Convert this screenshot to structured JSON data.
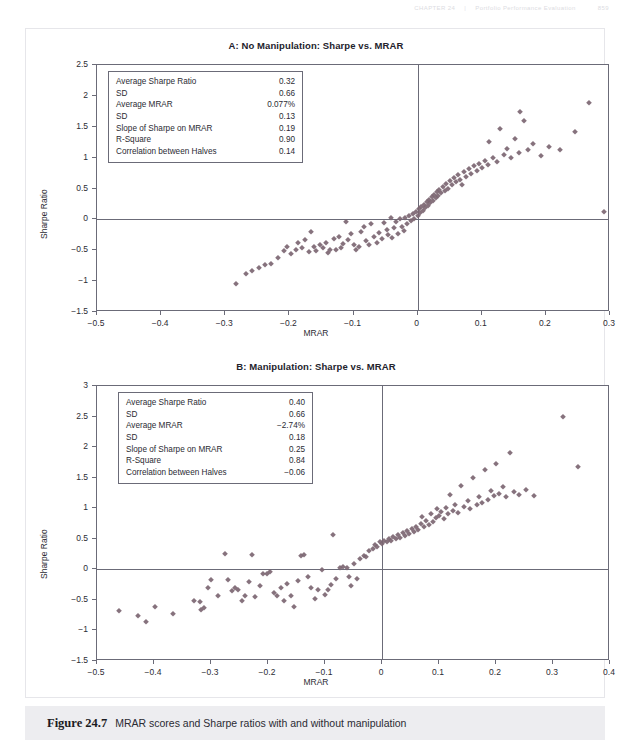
{
  "running_head": {
    "left": "CHAPTER 24",
    "section": "Portfolio Performance Evaluation",
    "page": "859"
  },
  "caption": {
    "figure_number": "Figure 24.7",
    "text": "MRAR scores and Sharpe ratios with and without manipulation"
  },
  "chart_data": [
    {
      "id": "panel-a",
      "type": "scatter",
      "title": "A: No Manipulation: Sharpe vs. MRAR",
      "xlabel": "MRAR",
      "ylabel": "Sharpe Ratio",
      "xlim": [
        -0.5,
        0.3
      ],
      "ylim": [
        -1.5,
        2.5
      ],
      "xticks": [
        -0.5,
        -0.4,
        -0.3,
        -0.2,
        -0.1,
        0,
        0.1,
        0.2,
        0.3
      ],
      "xticklabels": [
        "−0.5",
        "−0.4",
        "−0.3",
        "−0.2",
        "−0.1",
        "0",
        "0.1",
        "0.2",
        "0.3"
      ],
      "yticks": [
        -1.5,
        -1,
        -0.5,
        0,
        0.5,
        1,
        1.5,
        2,
        2.5
      ],
      "yticklabels": [
        "−1.5",
        "−1",
        "−0.5",
        "0",
        "0.5",
        "1",
        "1.5",
        "2",
        "2.5"
      ],
      "grid": false,
      "legend": null,
      "marker": {
        "shape": "diamond",
        "color": "#7c6672",
        "size": 4.4
      },
      "stats": [
        {
          "label": "Average Sharpe Ratio",
          "value": "0.32"
        },
        {
          "label": "SD",
          "value": "0.66"
        },
        {
          "label": "Average MRAR",
          "value": "0.077%"
        },
        {
          "label": "SD",
          "value": "0.13"
        },
        {
          "label": "Slope of Sharpe on MRAR",
          "value": "0.19"
        },
        {
          "label": "R-Square",
          "value": "0.90"
        },
        {
          "label": "Correlation between Halves",
          "value": "0.14"
        }
      ],
      "points": [
        [
          -0.283,
          -1.05
        ],
        [
          -0.268,
          -0.88
        ],
        [
          -0.258,
          -0.83
        ],
        [
          -0.248,
          -0.78
        ],
        [
          -0.238,
          -0.74
        ],
        [
          -0.228,
          -0.73
        ],
        [
          -0.218,
          -0.62
        ],
        [
          -0.209,
          -0.52
        ],
        [
          -0.203,
          -0.44
        ],
        [
          -0.197,
          -0.56
        ],
        [
          -0.19,
          -0.49
        ],
        [
          -0.186,
          -0.38
        ],
        [
          -0.181,
          -0.46
        ],
        [
          -0.176,
          -0.33
        ],
        [
          -0.17,
          -0.53
        ],
        [
          -0.166,
          -0.21
        ],
        [
          -0.162,
          -0.45
        ],
        [
          -0.158,
          -0.51
        ],
        [
          -0.152,
          -0.42
        ],
        [
          -0.148,
          -0.47
        ],
        [
          -0.143,
          -0.38
        ],
        [
          -0.14,
          -0.55
        ],
        [
          -0.136,
          -0.5
        ],
        [
          -0.131,
          -0.32
        ],
        [
          -0.127,
          -0.49
        ],
        [
          -0.123,
          -0.28
        ],
        [
          -0.12,
          -0.46
        ],
        [
          -0.116,
          -0.4
        ],
        [
          -0.112,
          -0.05
        ],
        [
          -0.108,
          -0.34
        ],
        [
          -0.104,
          -0.23
        ],
        [
          -0.1,
          -0.41
        ],
        [
          -0.096,
          -0.49
        ],
        [
          -0.092,
          -0.44
        ],
        [
          -0.088,
          -0.2
        ],
        [
          -0.084,
          -0.13
        ],
        [
          -0.08,
          -0.35
        ],
        [
          -0.076,
          -0.42
        ],
        [
          -0.072,
          -0.08
        ],
        [
          -0.068,
          -0.29
        ],
        [
          -0.064,
          -0.38
        ],
        [
          -0.06,
          -0.22
        ],
        [
          -0.056,
          -0.32
        ],
        [
          -0.052,
          -0.06
        ],
        [
          -0.048,
          -0.18
        ],
        [
          -0.046,
          -0.26
        ],
        [
          -0.042,
          0.03
        ],
        [
          -0.04,
          -0.3
        ],
        [
          -0.037,
          -0.14
        ],
        [
          -0.034,
          -0.05
        ],
        [
          -0.031,
          -0.24
        ],
        [
          -0.028,
          0.0
        ],
        [
          -0.025,
          -0.12
        ],
        [
          -0.022,
          -0.19
        ],
        [
          -0.019,
          0.02
        ],
        [
          -0.016,
          -0.08
        ],
        [
          -0.013,
          0.05
        ],
        [
          -0.01,
          -0.03
        ],
        [
          -0.007,
          0.09
        ],
        [
          -0.005,
          0.01
        ],
        [
          -0.003,
          0.12
        ],
        [
          0.0,
          0.06
        ],
        [
          0.002,
          0.16
        ],
        [
          0.004,
          0.11
        ],
        [
          0.006,
          0.2
        ],
        [
          0.008,
          0.14
        ],
        [
          0.01,
          0.24
        ],
        [
          0.012,
          0.18
        ],
        [
          0.014,
          0.28
        ],
        [
          0.016,
          0.22
        ],
        [
          0.018,
          0.32
        ],
        [
          0.02,
          0.26
        ],
        [
          0.022,
          0.36
        ],
        [
          0.024,
          0.3
        ],
        [
          0.026,
          0.4
        ],
        [
          0.028,
          0.34
        ],
        [
          0.03,
          0.44
        ],
        [
          0.032,
          0.38
        ],
        [
          0.034,
          0.48
        ],
        [
          0.036,
          0.42
        ],
        [
          0.039,
          0.52
        ],
        [
          0.042,
          0.46
        ],
        [
          0.045,
          0.57
        ],
        [
          0.048,
          0.5
        ],
        [
          0.051,
          0.62
        ],
        [
          0.054,
          0.55
        ],
        [
          0.057,
          0.67
        ],
        [
          0.06,
          0.6
        ],
        [
          0.063,
          0.72
        ],
        [
          0.066,
          0.64
        ],
        [
          0.069,
          0.55
        ],
        [
          0.072,
          0.76
        ],
        [
          0.076,
          0.69
        ],
        [
          0.08,
          0.81
        ],
        [
          0.084,
          0.74
        ],
        [
          0.088,
          0.86
        ],
        [
          0.092,
          0.78
        ],
        [
          0.096,
          0.9
        ],
        [
          0.1,
          0.83
        ],
        [
          0.105,
          0.95
        ],
        [
          0.11,
          0.88
        ],
        [
          0.112,
          1.26
        ],
        [
          0.118,
          1.0
        ],
        [
          0.124,
          0.93
        ],
        [
          0.128,
          1.46
        ],
        [
          0.134,
          1.05
        ],
        [
          0.14,
          1.14
        ],
        [
          0.146,
          1.0
        ],
        [
          0.152,
          1.3
        ],
        [
          0.158,
          1.08
        ],
        [
          0.16,
          1.74
        ],
        [
          0.166,
          1.6
        ],
        [
          0.172,
          1.12
        ],
        [
          0.18,
          1.22
        ],
        [
          0.192,
          1.02
        ],
        [
          0.205,
          1.18
        ],
        [
          0.222,
          1.12
        ],
        [
          0.245,
          1.42
        ],
        [
          0.268,
          1.88
        ],
        [
          0.29,
          0.12
        ]
      ]
    },
    {
      "id": "panel-b",
      "type": "scatter",
      "title": "B: Manipulation: Sharpe vs. MRAR",
      "xlabel": "MRAR",
      "ylabel": "Sharpe Ratio",
      "xlim": [
        -0.5,
        0.4
      ],
      "ylim": [
        -1.5,
        3
      ],
      "xticks": [
        -0.5,
        -0.4,
        -0.3,
        -0.2,
        -0.1,
        0,
        0.1,
        0.2,
        0.3,
        0.4
      ],
      "xticklabels": [
        "−0.5",
        "−0.4",
        "−0.3",
        "−0.2",
        "−0.1",
        "0",
        "0.1",
        "0.2",
        "0.3",
        "0.4"
      ],
      "yticks": [
        -1.5,
        -1,
        -0.5,
        0,
        0.5,
        1,
        1.5,
        2,
        2.5,
        3
      ],
      "yticklabels": [
        "−1.5",
        "−1",
        "−0.5",
        "0",
        "0.5",
        "1",
        "1.5",
        "2",
        "2.5",
        "3"
      ],
      "grid": false,
      "legend": null,
      "marker": {
        "shape": "diamond",
        "color": "#7c6672",
        "size": 4.4
      },
      "stats": [
        {
          "label": "Average Sharpe Ratio",
          "value": "0.40"
        },
        {
          "label": "SD",
          "value": "0.66"
        },
        {
          "label": "Average MRAR",
          "value": "−2.74%"
        },
        {
          "label": "SD",
          "value": "0.18"
        },
        {
          "label": "Slope of Sharpe on MRAR",
          "value": "0.25"
        },
        {
          "label": "R-Square",
          "value": "0.84"
        },
        {
          "label": "Correlation between Halves",
          "value": "−0.06"
        }
      ],
      "points": [
        [
          -0.462,
          -0.68
        ],
        [
          -0.428,
          -0.76
        ],
        [
          -0.414,
          -0.86
        ],
        [
          -0.398,
          -0.62
        ],
        [
          -0.366,
          -0.73
        ],
        [
          -0.33,
          -0.52
        ],
        [
          -0.32,
          -0.54
        ],
        [
          -0.318,
          -0.66
        ],
        [
          -0.312,
          -0.64
        ],
        [
          -0.306,
          -0.3
        ],
        [
          -0.3,
          -0.17
        ],
        [
          -0.288,
          -0.44
        ],
        [
          -0.276,
          0.25
        ],
        [
          -0.27,
          -0.18
        ],
        [
          -0.264,
          -0.36
        ],
        [
          -0.258,
          -0.3
        ],
        [
          -0.252,
          -0.33
        ],
        [
          -0.246,
          -0.52
        ],
        [
          -0.24,
          -0.44
        ],
        [
          -0.234,
          -0.2
        ],
        [
          -0.228,
          0.24
        ],
        [
          -0.222,
          -0.46
        ],
        [
          -0.214,
          -0.27
        ],
        [
          -0.208,
          -0.07
        ],
        [
          -0.202,
          -0.08
        ],
        [
          -0.196,
          -0.05
        ],
        [
          -0.19,
          -0.38
        ],
        [
          -0.184,
          -0.44
        ],
        [
          -0.178,
          -0.3
        ],
        [
          -0.172,
          -0.52
        ],
        [
          -0.166,
          -0.24
        ],
        [
          -0.16,
          -0.44
        ],
        [
          -0.154,
          -0.62
        ],
        [
          -0.148,
          -0.19
        ],
        [
          -0.142,
          0.22
        ],
        [
          -0.136,
          0.24
        ],
        [
          -0.13,
          -0.12
        ],
        [
          -0.124,
          -0.31
        ],
        [
          -0.118,
          -0.48
        ],
        [
          -0.112,
          -0.33
        ],
        [
          -0.106,
          -0.01
        ],
        [
          -0.1,
          -0.42
        ],
        [
          -0.094,
          -0.34
        ],
        [
          -0.09,
          -0.25
        ],
        [
          -0.086,
          0.56
        ],
        [
          -0.08,
          -0.16
        ],
        [
          -0.074,
          0.02
        ],
        [
          -0.068,
          0.04
        ],
        [
          -0.062,
          0.03
        ],
        [
          -0.058,
          -0.12
        ],
        [
          -0.054,
          -0.27
        ],
        [
          -0.05,
          0.08
        ],
        [
          -0.044,
          -0.15
        ],
        [
          -0.038,
          0.17
        ],
        [
          -0.032,
          0.22
        ],
        [
          -0.028,
          0.2
        ],
        [
          -0.022,
          0.3
        ],
        [
          -0.016,
          0.33
        ],
        [
          -0.012,
          0.4
        ],
        [
          -0.008,
          0.37
        ],
        [
          -0.004,
          0.44
        ],
        [
          0.0,
          0.41
        ],
        [
          0.004,
          0.47
        ],
        [
          0.008,
          0.44
        ],
        [
          0.012,
          0.5
        ],
        [
          0.016,
          0.46
        ],
        [
          0.02,
          0.53
        ],
        [
          0.024,
          0.49
        ],
        [
          0.028,
          0.56
        ],
        [
          0.032,
          0.52
        ],
        [
          0.036,
          0.59
        ],
        [
          0.04,
          0.55
        ],
        [
          0.044,
          0.62
        ],
        [
          0.048,
          0.58
        ],
        [
          0.052,
          0.66
        ],
        [
          0.056,
          0.61
        ],
        [
          0.06,
          0.7
        ],
        [
          0.064,
          0.65
        ],
        [
          0.068,
          0.74
        ],
        [
          0.07,
          0.86
        ],
        [
          0.074,
          0.69
        ],
        [
          0.078,
          0.79
        ],
        [
          0.082,
          0.73
        ],
        [
          0.086,
          0.9
        ],
        [
          0.09,
          0.78
        ],
        [
          0.094,
          0.84
        ],
        [
          0.096,
          0.99
        ],
        [
          0.1,
          0.88
        ],
        [
          0.104,
          0.94
        ],
        [
          0.108,
          0.82
        ],
        [
          0.112,
          1.0
        ],
        [
          0.116,
          0.9
        ],
        [
          0.12,
          1.22
        ],
        [
          0.124,
          0.96
        ],
        [
          0.128,
          1.06
        ],
        [
          0.134,
          0.93
        ],
        [
          0.138,
          1.36
        ],
        [
          0.144,
          1.02
        ],
        [
          0.15,
          1.12
        ],
        [
          0.154,
          0.98
        ],
        [
          0.16,
          1.5
        ],
        [
          0.166,
          1.06
        ],
        [
          0.17,
          1.18
        ],
        [
          0.176,
          1.08
        ],
        [
          0.18,
          1.62
        ],
        [
          0.186,
          1.14
        ],
        [
          0.192,
          1.28
        ],
        [
          0.196,
          1.2
        ],
        [
          0.2,
          1.73
        ],
        [
          0.206,
          1.24
        ],
        [
          0.212,
          1.34
        ],
        [
          0.218,
          1.18
        ],
        [
          0.224,
          1.9
        ],
        [
          0.232,
          1.26
        ],
        [
          0.24,
          1.22
        ],
        [
          0.252,
          1.3
        ],
        [
          0.266,
          1.2
        ],
        [
          0.318,
          2.5
        ],
        [
          0.344,
          1.68
        ]
      ]
    }
  ]
}
